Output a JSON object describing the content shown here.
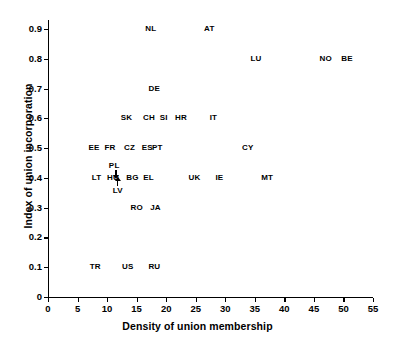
{
  "chart_data": {
    "type": "scatter",
    "title": "",
    "xlabel": "Density of union membership",
    "ylabel": "Index of union incorporation",
    "xlim": [
      0,
      55
    ],
    "ylim": [
      0,
      0.93
    ],
    "xticks": [
      "0",
      "5",
      "10",
      "15",
      "20",
      "25",
      "30",
      "35",
      "40",
      "45",
      "50",
      "55"
    ],
    "xtick_values": [
      0,
      5,
      10,
      15,
      20,
      25,
      30,
      35,
      40,
      45,
      50,
      55
    ],
    "yticks": [
      "0",
      "0.1",
      "0.2",
      "0.3",
      "0.4",
      "0.5",
      "0.6",
      "0.7",
      "0.8",
      "0.9"
    ],
    "ytick_values": [
      0,
      0.1,
      0.2,
      0.3,
      0.4,
      0.5,
      0.6,
      0.7,
      0.8,
      0.9
    ],
    "grid": false,
    "legend": "none",
    "marker_style": "text-label",
    "points": [
      {
        "label": "NL",
        "x": 17.4,
        "y": 0.9
      },
      {
        "label": "AT",
        "x": 27.3,
        "y": 0.9
      },
      {
        "label": "LU",
        "x": 35.2,
        "y": 0.8
      },
      {
        "label": "NO",
        "x": 47.0,
        "y": 0.8
      },
      {
        "label": "BE",
        "x": 50.6,
        "y": 0.8
      },
      {
        "label": "SE",
        "x": 67.5,
        "y": 0.8
      },
      {
        "label": "DE",
        "x": 18.0,
        "y": 0.7
      },
      {
        "label": "DK",
        "x": 67.5,
        "y": 0.7
      },
      {
        "label": "SK",
        "x": 13.3,
        "y": 0.6
      },
      {
        "label": "CH",
        "x": 17.1,
        "y": 0.6
      },
      {
        "label": "SI",
        "x": 19.6,
        "y": 0.6
      },
      {
        "label": "HR",
        "x": 22.5,
        "y": 0.6
      },
      {
        "label": "IT",
        "x": 28.0,
        "y": 0.6
      },
      {
        "label": "FI",
        "x": 66.8,
        "y": 0.6
      },
      {
        "label": "EE",
        "x": 7.8,
        "y": 0.5
      },
      {
        "label": "FR",
        "x": 10.5,
        "y": 0.5
      },
      {
        "label": "CZ",
        "x": 13.8,
        "y": 0.5
      },
      {
        "label": "ES",
        "x": 16.8,
        "y": 0.5
      },
      {
        "label": "PT",
        "x": 18.5,
        "y": 0.5
      },
      {
        "label": "CY",
        "x": 33.8,
        "y": 0.5
      },
      {
        "label": "PL",
        "x": 11.2,
        "y": 0.44
      },
      {
        "label": "LT",
        "x": 8.2,
        "y": 0.4
      },
      {
        "label": "HU",
        "x": 11.0,
        "y": 0.4
      },
      {
        "label": "BG",
        "x": 14.3,
        "y": 0.4
      },
      {
        "label": "EL",
        "x": 17.0,
        "y": 0.4
      },
      {
        "label": "UK",
        "x": 24.8,
        "y": 0.4
      },
      {
        "label": "IE",
        "x": 29.0,
        "y": 0.4
      },
      {
        "label": "MT",
        "x": 37.1,
        "y": 0.4
      },
      {
        "label": "LV",
        "x": 11.8,
        "y": 0.355
      },
      {
        "label": "RO",
        "x": 15.0,
        "y": 0.3
      },
      {
        "label": "JA",
        "x": 18.2,
        "y": 0.3
      },
      {
        "label": "TR",
        "x": 8.0,
        "y": 0.1
      },
      {
        "label": "US",
        "x": 13.5,
        "y": 0.1
      },
      {
        "label": "RU",
        "x": 18.0,
        "y": 0.1
      }
    ],
    "annotations": [
      {
        "name": "pl-arrow",
        "direction": "down",
        "x": 11.4,
        "y_from": 0.425,
        "y_to": 0.405
      },
      {
        "name": "lv-arrow",
        "direction": "up",
        "x": 11.7,
        "y_from": 0.372,
        "y_to": 0.392
      }
    ]
  }
}
